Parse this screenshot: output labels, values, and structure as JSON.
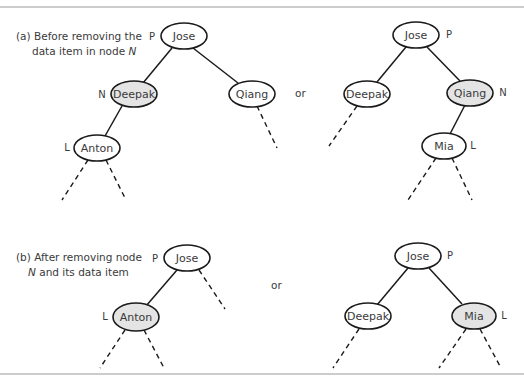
{
  "figure": {
    "highlight_color": "#e4e4e4",
    "or_label": "or",
    "panel_a": {
      "caption_line1": "(a) Before removing the",
      "caption_line2_prefix": "data item in node ",
      "caption_line2_italic": "N",
      "left_tree": {
        "nodes": [
          {
            "id": "jose",
            "label": "Jose",
            "tag": "P",
            "highlighted": false
          },
          {
            "id": "deepak",
            "label": "Deepak",
            "tag": "N",
            "highlighted": true
          },
          {
            "id": "qiang",
            "label": "Qiang",
            "tag": "",
            "highlighted": false
          },
          {
            "id": "anton",
            "label": "Anton",
            "tag": "L",
            "highlighted": false
          }
        ]
      },
      "right_tree": {
        "nodes": [
          {
            "id": "jose",
            "label": "Jose",
            "tag": "P",
            "highlighted": false
          },
          {
            "id": "deepak",
            "label": "Deepak",
            "tag": "",
            "highlighted": false
          },
          {
            "id": "qiang",
            "label": "Qiang",
            "tag": "N",
            "highlighted": true
          },
          {
            "id": "mia",
            "label": "Mia",
            "tag": "L",
            "highlighted": false
          }
        ]
      }
    },
    "panel_b": {
      "caption_line1": "(b) After removing node",
      "caption_line2_italic": "N",
      "caption_line2_suffix": " and its data item",
      "left_tree": {
        "nodes": [
          {
            "id": "jose",
            "label": "Jose",
            "tag": "P",
            "highlighted": false
          },
          {
            "id": "anton",
            "label": "Anton",
            "tag": "L",
            "highlighted": true
          }
        ]
      },
      "right_tree": {
        "nodes": [
          {
            "id": "jose",
            "label": "Jose",
            "tag": "P",
            "highlighted": false
          },
          {
            "id": "deepak",
            "label": "Deepak",
            "tag": "",
            "highlighted": false
          },
          {
            "id": "mia",
            "label": "Mia",
            "tag": "L",
            "highlighted": true
          }
        ]
      }
    }
  }
}
